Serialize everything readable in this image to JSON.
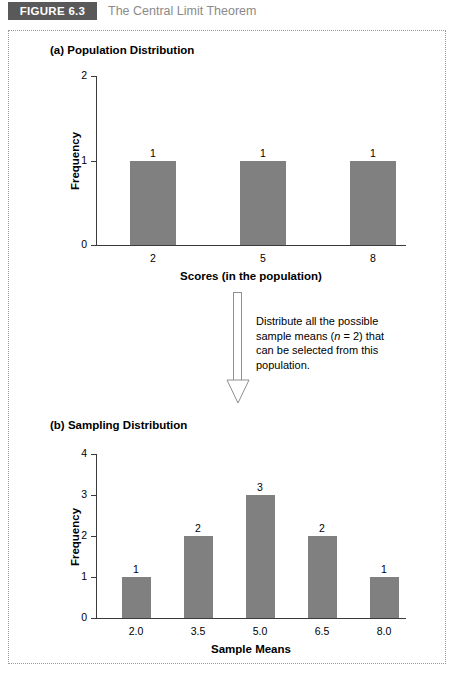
{
  "header": {
    "badge": "FIGURE 6.3",
    "title": "The Central Limit Theorem"
  },
  "annotation": {
    "line1": "Distribute all the possible",
    "line2_pre": "sample means (",
    "line2_italic": "n",
    "line2_post": " = 2) that",
    "line3": "can be selected from this",
    "line4": "population."
  },
  "colors": {
    "bar": "#808080",
    "badge_bg": "#595959",
    "title_gray": "#8a8a8a",
    "axis": "#3a3a3a",
    "frame_dots": "#9a9a9a",
    "arrow_outline": "#8f8f8f"
  },
  "panels": {
    "a": {
      "title": "(a) Population Distribution"
    },
    "b": {
      "title": "(b) Sampling Distribution"
    }
  },
  "chart_data": [
    {
      "type": "bar",
      "id": "population-distribution",
      "title": "(a) Population Distribution",
      "categories": [
        "2",
        "5",
        "8"
      ],
      "values": [
        1,
        1,
        1
      ],
      "data_labels": [
        "1",
        "1",
        "1"
      ],
      "xlabel": "Scores (in the population)",
      "ylabel": "Frequency",
      "ylim": [
        0,
        2
      ],
      "yticks": [
        0,
        1,
        2
      ],
      "ytick_labels": [
        "0",
        "1",
        "2"
      ],
      "grid": false,
      "legend": "none",
      "bar_color": "#808080"
    },
    {
      "type": "bar",
      "id": "sampling-distribution",
      "title": "(b) Sampling Distribution",
      "categories": [
        "2.0",
        "3.5",
        "5.0",
        "6.5",
        "8.0"
      ],
      "values": [
        1,
        2,
        3,
        2,
        1
      ],
      "data_labels": [
        "1",
        "2",
        "3",
        "2",
        "1"
      ],
      "xlabel": "Sample Means",
      "ylabel": "Frequency",
      "ylim": [
        0,
        4
      ],
      "yticks": [
        0,
        1,
        2,
        3,
        4
      ],
      "ytick_labels": [
        "0",
        "1",
        "2",
        "3",
        "4"
      ],
      "grid": false,
      "legend": "none",
      "bar_color": "#808080"
    }
  ]
}
